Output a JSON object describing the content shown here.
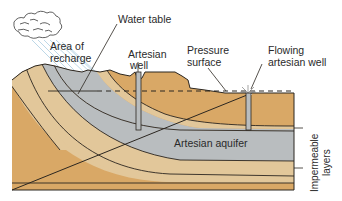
{
  "diagram": {
    "type": "geologic-cross-section",
    "labels": {
      "water_table": "Water table",
      "area_of_recharge_line1": "Area of",
      "area_of_recharge_line2": "recharge",
      "artesian_well_line1": "Artesian",
      "artesian_well_line2": "well",
      "pressure_surface_line1": "Pressure",
      "pressure_surface_line2": "surface",
      "flowing_well_line1": "Flowing",
      "flowing_well_line2": "artesian well",
      "artesian_aquifer": "Artesian aquifer",
      "impermeable_line1": "Impermeable",
      "impermeable_line2": "layers"
    },
    "colors": {
      "aquifer": "#b9bdbf",
      "sandstone_light": "#e2c79a",
      "sediment_tan": "#d9a866",
      "outline": "#2b2620",
      "rain": "#a9cde0",
      "background": "#ffffff"
    }
  }
}
